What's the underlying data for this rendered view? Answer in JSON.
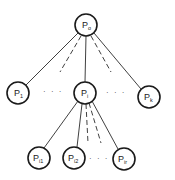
{
  "diagram": {
    "type": "tree",
    "colors": {
      "stroke": "#1a1a1a",
      "background": "#ffffff"
    },
    "nodes": [
      {
        "id": "root",
        "base": "P",
        "sub": "o",
        "cx": 86,
        "cy": 25,
        "r": 11
      },
      {
        "id": "p1",
        "base": "P",
        "sub": "1",
        "cx": 18,
        "cy": 93,
        "r": 11
      },
      {
        "id": "pi",
        "base": "P",
        "sub": "i",
        "cx": 85,
        "cy": 93,
        "r": 11
      },
      {
        "id": "pk",
        "base": "P",
        "sub": "k",
        "cx": 149,
        "cy": 97,
        "r": 11
      },
      {
        "id": "pi1",
        "base": "P",
        "sub": "i1",
        "cx": 39,
        "cy": 158,
        "r": 11
      },
      {
        "id": "pi2",
        "base": "P",
        "sub": "i2",
        "cx": 74,
        "cy": 158,
        "r": 11
      },
      {
        "id": "pir",
        "base": "P",
        "sub": "ir",
        "cx": 124,
        "cy": 159,
        "r": 11
      }
    ],
    "edges": [
      {
        "from": "root",
        "to": "p1",
        "style": "solid"
      },
      {
        "from": "root",
        "to": "pi",
        "style": "solid"
      },
      {
        "from": "root",
        "to": "pk",
        "style": "solid"
      },
      {
        "from": "root",
        "to": "dash-left",
        "style": "dashed"
      },
      {
        "from": "root",
        "to": "dash-right",
        "style": "dashed"
      },
      {
        "from": "pi",
        "to": "pi1",
        "style": "solid"
      },
      {
        "from": "pi",
        "to": "pi2",
        "style": "solid"
      },
      {
        "from": "pi",
        "to": "pir",
        "style": "solid"
      },
      {
        "from": "pi",
        "to": "dash-c1",
        "style": "dashed"
      },
      {
        "from": "pi",
        "to": "dash-c2",
        "style": "dashed"
      }
    ],
    "ellipses": [
      {
        "id": "row1-left",
        "text": "· · ·"
      },
      {
        "id": "row1-right",
        "text": "· · ·"
      },
      {
        "id": "row2",
        "text": "· · ·"
      }
    ]
  }
}
